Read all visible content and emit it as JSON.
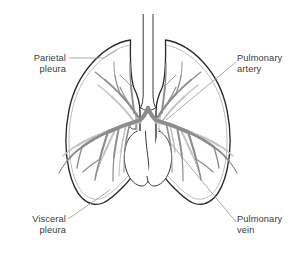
{
  "figure": {
    "background_color": "#ffffff",
    "outline_color": "#2b2b2b",
    "inner_pleura_color": "#b0b0b0",
    "artery_color": "#8c8c8c",
    "vein_color": "#c0c0c0",
    "leader_color": "#9a9a9a",
    "text_color": "#3b3b3b"
  },
  "labels": {
    "parietal_pleura": "Parietal\npleura",
    "visceral_pleura": "Visceral\npleura",
    "pulmonary_artery": "Pulmonary\nartery",
    "pulmonary_vein": "Pulmonary\nvein"
  },
  "parts": {
    "trachea": "trachea",
    "left_lung": "left-lung",
    "right_lung": "right-lung",
    "mediastinum": "mediastinum",
    "bronchial_tree": "bronchial-vascular-tree"
  }
}
